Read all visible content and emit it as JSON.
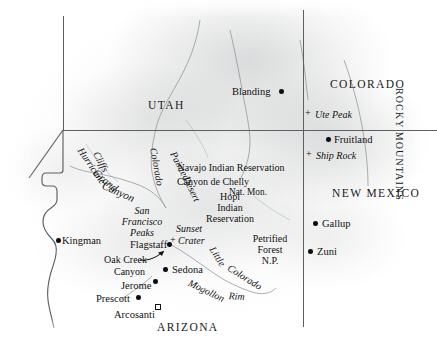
{
  "map": {
    "title": "Arizona and Four Corners Region Relief Map",
    "width": 437,
    "height": 339,
    "background_color": "#ffffff",
    "terrain_color": "#93969a",
    "border_color": "#5d5f62",
    "text_color": "#141414"
  },
  "states": [
    {
      "name": "UTAH",
      "x": 148,
      "y": 100
    },
    {
      "name": "COLORADO",
      "x": 330,
      "y": 79
    },
    {
      "name": "NEW MEXICO",
      "x": 332,
      "y": 188
    },
    {
      "name": "ARIZONA",
      "x": 157,
      "y": 322
    }
  ],
  "ranges": [
    {
      "name": "ROCKY MOUNTAINS",
      "x": 404,
      "y": 88
    }
  ],
  "cities": [
    {
      "name": "Blanding",
      "label_x": 232,
      "label_y": 87,
      "dot_x": 279,
      "dot_y": 89,
      "anchor": "left",
      "marker": "dot"
    },
    {
      "name": "Fruitland",
      "label_x": 334,
      "label_y": 135,
      "dot_x": 326,
      "dot_y": 137,
      "anchor": "left",
      "marker": "dot"
    },
    {
      "name": "Gallup",
      "label_x": 322,
      "label_y": 219,
      "dot_x": 313,
      "dot_y": 221,
      "anchor": "left",
      "marker": "dot"
    },
    {
      "name": "Zuni",
      "label_x": 317,
      "label_y": 247,
      "dot_x": 308,
      "dot_y": 249,
      "anchor": "left",
      "marker": "dot"
    },
    {
      "name": "Kingman",
      "label_x": 62,
      "label_y": 236,
      "dot_x": 56,
      "dot_y": 238,
      "anchor": "left",
      "marker": "dot"
    },
    {
      "name": "Flagstaff",
      "label_x": 130,
      "label_y": 240,
      "dot_x": 167,
      "dot_y": 242,
      "anchor": "left",
      "marker": "dot"
    },
    {
      "name": "Sedona",
      "label_x": 172,
      "label_y": 265,
      "dot_x": 163,
      "dot_y": 267,
      "anchor": "left",
      "marker": "dot"
    },
    {
      "name": "Jerome",
      "label_x": 121,
      "label_y": 281,
      "dot_x": 153,
      "dot_y": 279,
      "anchor": "left",
      "marker": "dot"
    },
    {
      "name": "Prescott",
      "label_x": 96,
      "label_y": 294,
      "dot_x": 136,
      "dot_y": 295,
      "anchor": "left",
      "marker": "dot"
    },
    {
      "name": "Arcosanti",
      "label_x": 114,
      "label_y": 310,
      "dot_x": 155,
      "dot_y": 304,
      "anchor": "left",
      "marker": "square"
    }
  ],
  "peaks": [
    {
      "name": "Ute Peak",
      "label_x": 315,
      "label_y": 110,
      "cross_x": 305,
      "cross_y": 108
    },
    {
      "name": "Ship Rock",
      "label_x": 316,
      "label_y": 151,
      "cross_x": 306,
      "cross_y": 149
    },
    {
      "name": "Sunset",
      "label_x": 176,
      "label_y": 224,
      "cross_x": 170,
      "cross_y": 235
    },
    {
      "name": "Crater",
      "label_x": 178,
      "label_y": 236,
      "cross_x": null,
      "cross_y": null
    }
  ],
  "features": [
    {
      "name": "Hurricane",
      "x": 84,
      "y": 146,
      "rotate": 56,
      "style": "italic"
    },
    {
      "name": "Cliffs",
      "x": 100,
      "y": 150,
      "rotate": 62,
      "style": "italic"
    },
    {
      "name": "Grand",
      "x": 98,
      "y": 167,
      "rotate": 40,
      "style": "italic"
    },
    {
      "name": "Canyon",
      "x": 105,
      "y": 180,
      "rotate": 24,
      "style": "italic"
    },
    {
      "name": "Colorado",
      "x": 158,
      "y": 147,
      "rotate": 80,
      "style": "italic"
    },
    {
      "name": "Painted",
      "x": 177,
      "y": 150,
      "rotate": 62,
      "style": "italic"
    },
    {
      "name": "Desert",
      "x": 190,
      "y": 175,
      "rotate": 64,
      "style": "italic"
    },
    {
      "name": "Little",
      "x": 216,
      "y": 245,
      "rotate": 58,
      "style": "italic"
    },
    {
      "name": "Colorado",
      "x": 231,
      "y": 263,
      "rotate": 32,
      "style": "italic"
    },
    {
      "name": "Mogollon",
      "x": 191,
      "y": 278,
      "rotate": 26,
      "style": "italic"
    },
    {
      "name": "Rim",
      "x": 229,
      "y": 291,
      "rotate": 4,
      "style": "italic"
    },
    {
      "name": "Oak Creek",
      "x": 104,
      "y": 255,
      "rotate": 0,
      "style": "roman"
    },
    {
      "name": "Canyon",
      "x": 114,
      "y": 267,
      "rotate": 0,
      "style": "roman"
    }
  ],
  "regions": [
    {
      "lines": [
        "San",
        "Francisco",
        "Peaks"
      ],
      "x": 142,
      "y": 206,
      "align": "center",
      "style": "italic"
    },
    {
      "lines": [
        "Navajo Indian Reservation"
      ],
      "x": 231,
      "y": 163,
      "align": "left",
      "style": "roman"
    },
    {
      "lines": [
        "Canyon de Chelly"
      ],
      "x": 213,
      "y": 177,
      "align": "left",
      "style": "roman"
    },
    {
      "lines": [
        "Nat. Mon."
      ],
      "x": 248,
      "y": 188,
      "align": "left",
      "style": "roman"
    },
    {
      "lines": [
        "Hopi",
        "Indian",
        "Reservation"
      ],
      "x": 230,
      "y": 192,
      "align": "center",
      "style": "roman"
    },
    {
      "lines": [
        "Petrified",
        "Forest",
        "N.P."
      ],
      "x": 270,
      "y": 234,
      "align": "center",
      "style": "roman"
    }
  ],
  "annotations": [
    {
      "type": "arrow",
      "from_x": 142,
      "from_y": 258,
      "to_x": 168,
      "to_y": 252,
      "label": "Oak Creek Canyon pointer"
    }
  ],
  "legend": {
    "dot": "city",
    "cross": "peak / volcanic feature",
    "square": "Arcosanti site"
  }
}
